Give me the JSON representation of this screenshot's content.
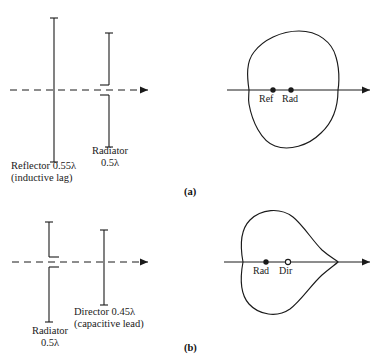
{
  "figure": {
    "background_color": "#ffffff",
    "line_color": "#1a1a1a",
    "panels": [
      {
        "id": "a",
        "caption": "(a)",
        "schematic": {
          "axis_style": "dashed-with-arrow",
          "elements": [
            {
              "name": "reflector",
              "type": "solid-dipole",
              "label_lines": [
                "Reflector 0.55λ",
                "(inductive lag)"
              ],
              "length_label": "0.55λ"
            },
            {
              "name": "radiator",
              "type": "split-fed-dipole",
              "label_lines": [
                "Radiator",
                "0.5λ"
              ],
              "length_label": "0.5λ"
            }
          ]
        },
        "pattern": {
          "type": "cardioid",
          "direction": "right",
          "markers": [
            {
              "label": "Ref",
              "style": "filled"
            },
            {
              "label": "Rad",
              "style": "filled"
            }
          ]
        }
      },
      {
        "id": "b",
        "caption": "(b)",
        "schematic": {
          "axis_style": "dashed-with-arrow",
          "elements": [
            {
              "name": "radiator",
              "type": "split-fed-dipole",
              "label_lines": [
                "Radiator",
                "0.5λ"
              ],
              "length_label": "0.5λ"
            },
            {
              "name": "director",
              "type": "solid-dipole",
              "label_lines": [
                "Director 0.45λ",
                "(capacitive lead)"
              ],
              "length_label": "0.45λ"
            }
          ]
        },
        "pattern": {
          "type": "cardioid",
          "direction": "right",
          "markers": [
            {
              "label": "Rad",
              "style": "filled"
            },
            {
              "label": "Dir",
              "style": "open"
            }
          ]
        }
      }
    ]
  }
}
